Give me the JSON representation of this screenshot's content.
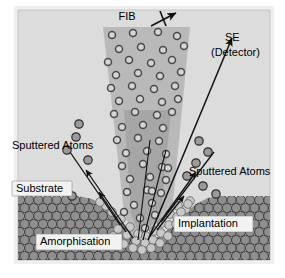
{
  "figure": {
    "canvas": {
      "width": 285,
      "height": 278
    },
    "background_color": "#ffffff",
    "frame_color": "#cfcfcf",
    "plot_background_color": "#dcdcdc"
  },
  "labels": {
    "fib": "FIB",
    "se": "SE",
    "detector": "(Detector)",
    "sputtered_atoms_left": "Sputtered Atoms",
    "sputtered_atoms_right": "Sputtered Atoms",
    "substrate": "Substrate",
    "amorphisation": "Amorphisation",
    "implantation": "Implantation"
  },
  "icons": {
    "fib_beam_arrow": "beam-arrow-icon",
    "se_arrow": "arrow-up-right-icon",
    "sputter_arrow": "arrow-icon"
  },
  "colors": {
    "beam_outer": "#b9b9b9",
    "beam_inner": "#a3a3a3",
    "substrate_atom_fill": "#8f8f8f",
    "substrate_atom_stroke": "#3a3a3a",
    "amorphous_atom_fill": "#c9c9c9",
    "ion_ring_stroke": "#4a4a4a",
    "ion_ring_fill": "#c4c4c4",
    "sputtered_atom_fill": "#9a9a9a",
    "line_color": "#111111",
    "label_box_fill": "#f2f2f2"
  },
  "diagram_data": {
    "type": "schematic",
    "description": "A focused ion beam (FIB) strikes a crystalline substrate, producing sputtered atoms, secondary electrons toward a detector, an amorphised surface layer and implanted ions.",
    "regions": [
      {
        "name": "beam-outer-cone",
        "label": "FIB",
        "shape": "trapezoid"
      },
      {
        "name": "beam-inner-cone",
        "label": "",
        "shape": "trapezoid"
      },
      {
        "name": "substrate-lattice",
        "label": "Substrate",
        "shape": "hexagonal-close-packed"
      },
      {
        "name": "amorphised-crater",
        "label": "Amorphisation",
        "shape": "disordered"
      },
      {
        "name": "implantation-zone",
        "label": "Implantation",
        "shape": "sub-surface"
      }
    ],
    "emissions": [
      {
        "name": "sputtered-atoms-left",
        "direction": "up-left",
        "count": 4
      },
      {
        "name": "sputtered-atoms-right",
        "direction": "up-right",
        "count": 4
      },
      {
        "name": "secondary-electrons",
        "direction": "up-right",
        "target": "SE (Detector)"
      }
    ]
  }
}
